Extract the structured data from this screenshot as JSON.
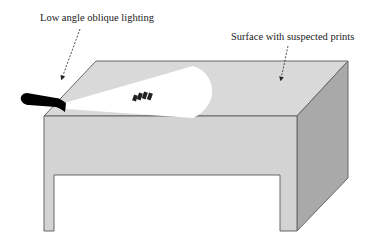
{
  "diagram": {
    "labels": {
      "lighting": "Low angle oblique lighting",
      "surface": "Surface with suspected prints"
    },
    "elements": {
      "table": "table-box",
      "flashlight": "flashlight",
      "light_beam": "light-beam",
      "prints": "fingerprint-marks"
    },
    "colors": {
      "top_face": "#d9d9d9",
      "front_face": "#d3d3d3",
      "side_face": "#a9a9a9",
      "beam": "#ffffff",
      "flashlight": "#000000",
      "outline": "#555555"
    }
  }
}
